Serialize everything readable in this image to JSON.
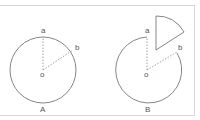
{
  "figure_a": {
    "label": "A",
    "point_a": "a",
    "point_b": "b",
    "center": "o"
  },
  "figure_b": {
    "label": "B",
    "point_a": "a",
    "point_b": "b",
    "center": "o"
  },
  "colors": {
    "stroke": "#777777",
    "border": "#d8d8d8"
  }
}
